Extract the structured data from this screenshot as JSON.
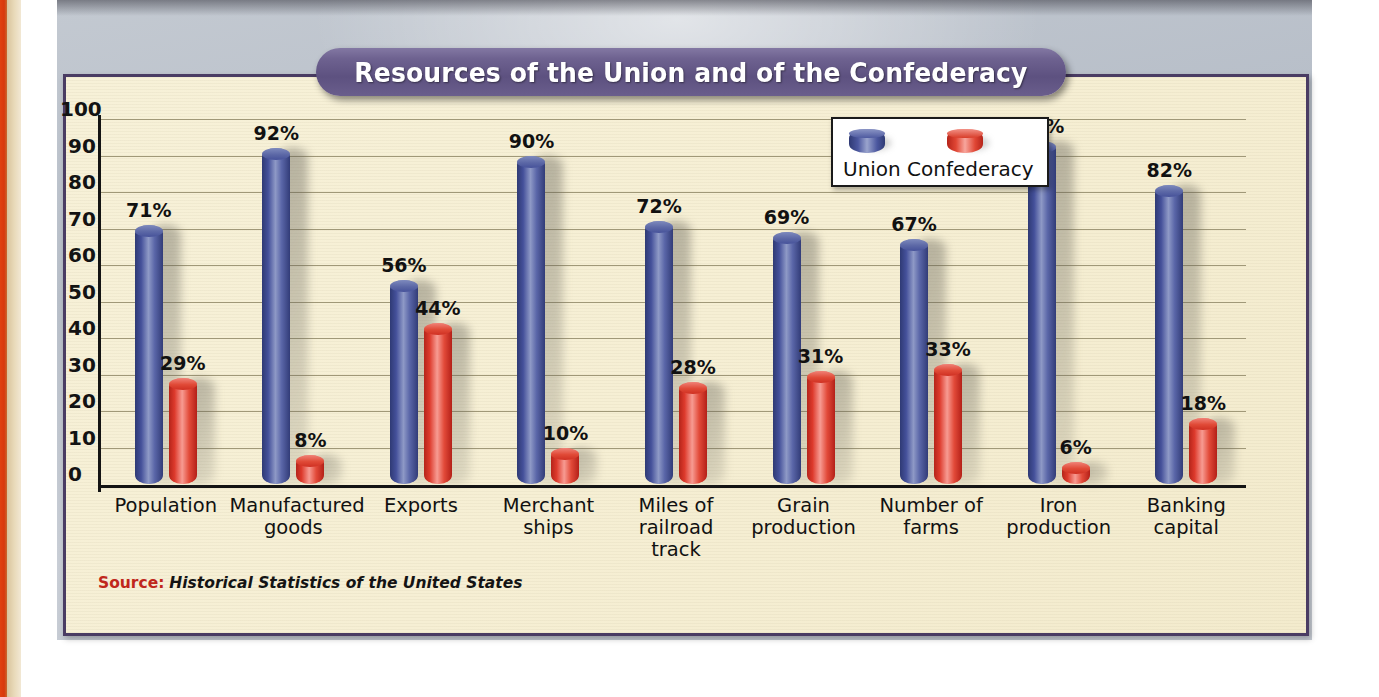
{
  "title": "Resources of the Union and of the Confederacy",
  "source": {
    "label": "Source:",
    "text": "Historical Statistics of the United States"
  },
  "legend": {
    "union": "Union",
    "confederacy": "Confederacy"
  },
  "colors": {
    "union": "#44509a",
    "confederacy": "#dd3a2c",
    "banner": "#5d5180",
    "plot_background": "#f6efd4",
    "frame": "#4a3c63",
    "source_label": "#c0271c",
    "page_edge": "#d8380c"
  },
  "chart_data": {
    "type": "bar",
    "title": "Resources of the Union and of the Confederacy",
    "xlabel": "",
    "ylabel": "",
    "ylim": [
      0,
      100
    ],
    "yticks": [
      100,
      90,
      80,
      70,
      60,
      50,
      40,
      30,
      20,
      10,
      0
    ],
    "grid": true,
    "legend_position": "top-right",
    "value_suffix": "%",
    "categories": [
      "Population",
      "Manufactured goods",
      "Exports",
      "Merchant ships",
      "Miles of railroad track",
      "Grain production",
      "Number of farms",
      "Iron production",
      "Banking capital"
    ],
    "category_lines": [
      [
        "Population"
      ],
      [
        "Manufactured",
        "goods"
      ],
      [
        "Exports"
      ],
      [
        "Merchant",
        "ships"
      ],
      [
        "Miles of",
        "railroad track"
      ],
      [
        "Grain",
        "production"
      ],
      [
        "Number of",
        "farms"
      ],
      [
        "Iron",
        "production"
      ],
      [
        "Banking",
        "capital"
      ]
    ],
    "series": [
      {
        "name": "Union",
        "values": [
          71,
          92,
          56,
          90,
          72,
          69,
          67,
          94,
          82
        ],
        "labels": [
          "71%",
          "92%",
          "56%",
          "90%",
          "72%",
          "69%",
          "67%",
          "94%",
          "82%"
        ]
      },
      {
        "name": "Confederacy",
        "values": [
          29,
          8,
          44,
          10,
          28,
          31,
          33,
          6,
          18
        ],
        "labels": [
          "29%",
          "8%",
          "44%",
          "10%",
          "28%",
          "31%",
          "33%",
          "6%",
          "18%"
        ]
      }
    ]
  }
}
